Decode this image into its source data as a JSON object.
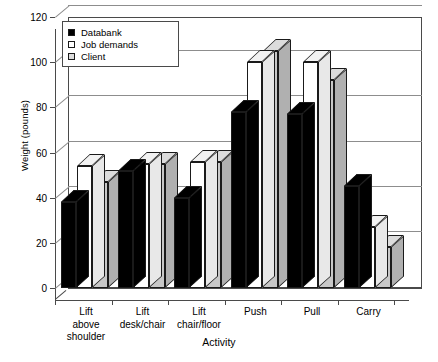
{
  "chart_data": {
    "type": "bar",
    "title": "",
    "subtitle": "",
    "xlabel": "Activity",
    "ylabel": "Weight (pounds)",
    "ylim": [
      0,
      120
    ],
    "yticks": [
      0,
      20,
      40,
      60,
      80,
      100,
      120
    ],
    "grid": true,
    "style": "3d-grouped-bar",
    "legend_position": "top-left-inside",
    "categories": [
      "Lift above shoulder",
      "Lift desk/chair",
      "Lift chair/floor",
      "Push",
      "Pull",
      "Carry"
    ],
    "category_lines": [
      [
        "Lift",
        "above",
        "shoulder"
      ],
      [
        "Lift",
        "desk/chair"
      ],
      [
        "Lift",
        "chair/floor"
      ],
      [
        "Push"
      ],
      [
        "Pull"
      ],
      [
        "Carry"
      ]
    ],
    "series": [
      {
        "name": "Databank",
        "color": "#000000",
        "side_color": "#000000",
        "top_color": "#000000",
        "values": [
          38,
          52,
          40,
          78,
          77,
          45
        ]
      },
      {
        "name": "Job demands",
        "color": "#ffffff",
        "side_color": "#e8e8e8",
        "top_color": "#f2f2f2",
        "values": [
          54,
          55,
          56,
          100,
          100,
          27
        ]
      },
      {
        "name": "Client",
        "color": "#c8c8c8",
        "side_color": "#b0b0b0",
        "top_color": "#dcdcdc",
        "values": [
          47,
          55,
          56,
          105,
          92,
          18
        ]
      }
    ]
  },
  "legend": {
    "items": [
      {
        "label": "Databank",
        "swatch": "#000000"
      },
      {
        "label": "Job demands",
        "swatch": "#ffffff"
      },
      {
        "label": "Client",
        "swatch": "#dcdcdc"
      }
    ]
  },
  "axes": {
    "y_title": "Weight (pounds)",
    "x_title": "Activity"
  }
}
